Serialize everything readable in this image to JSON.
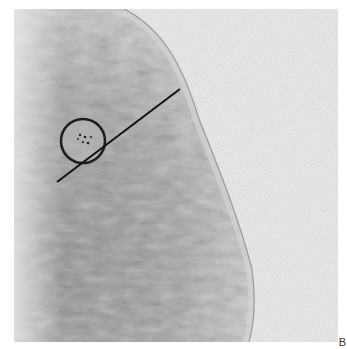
{
  "figure": {
    "panel_label": "B",
    "colors": {
      "background": "#e9e9e9",
      "tissue_dark": "#8a8a8a",
      "tissue_light": "#c8c8c8",
      "marker": "#1a1a1a"
    }
  }
}
